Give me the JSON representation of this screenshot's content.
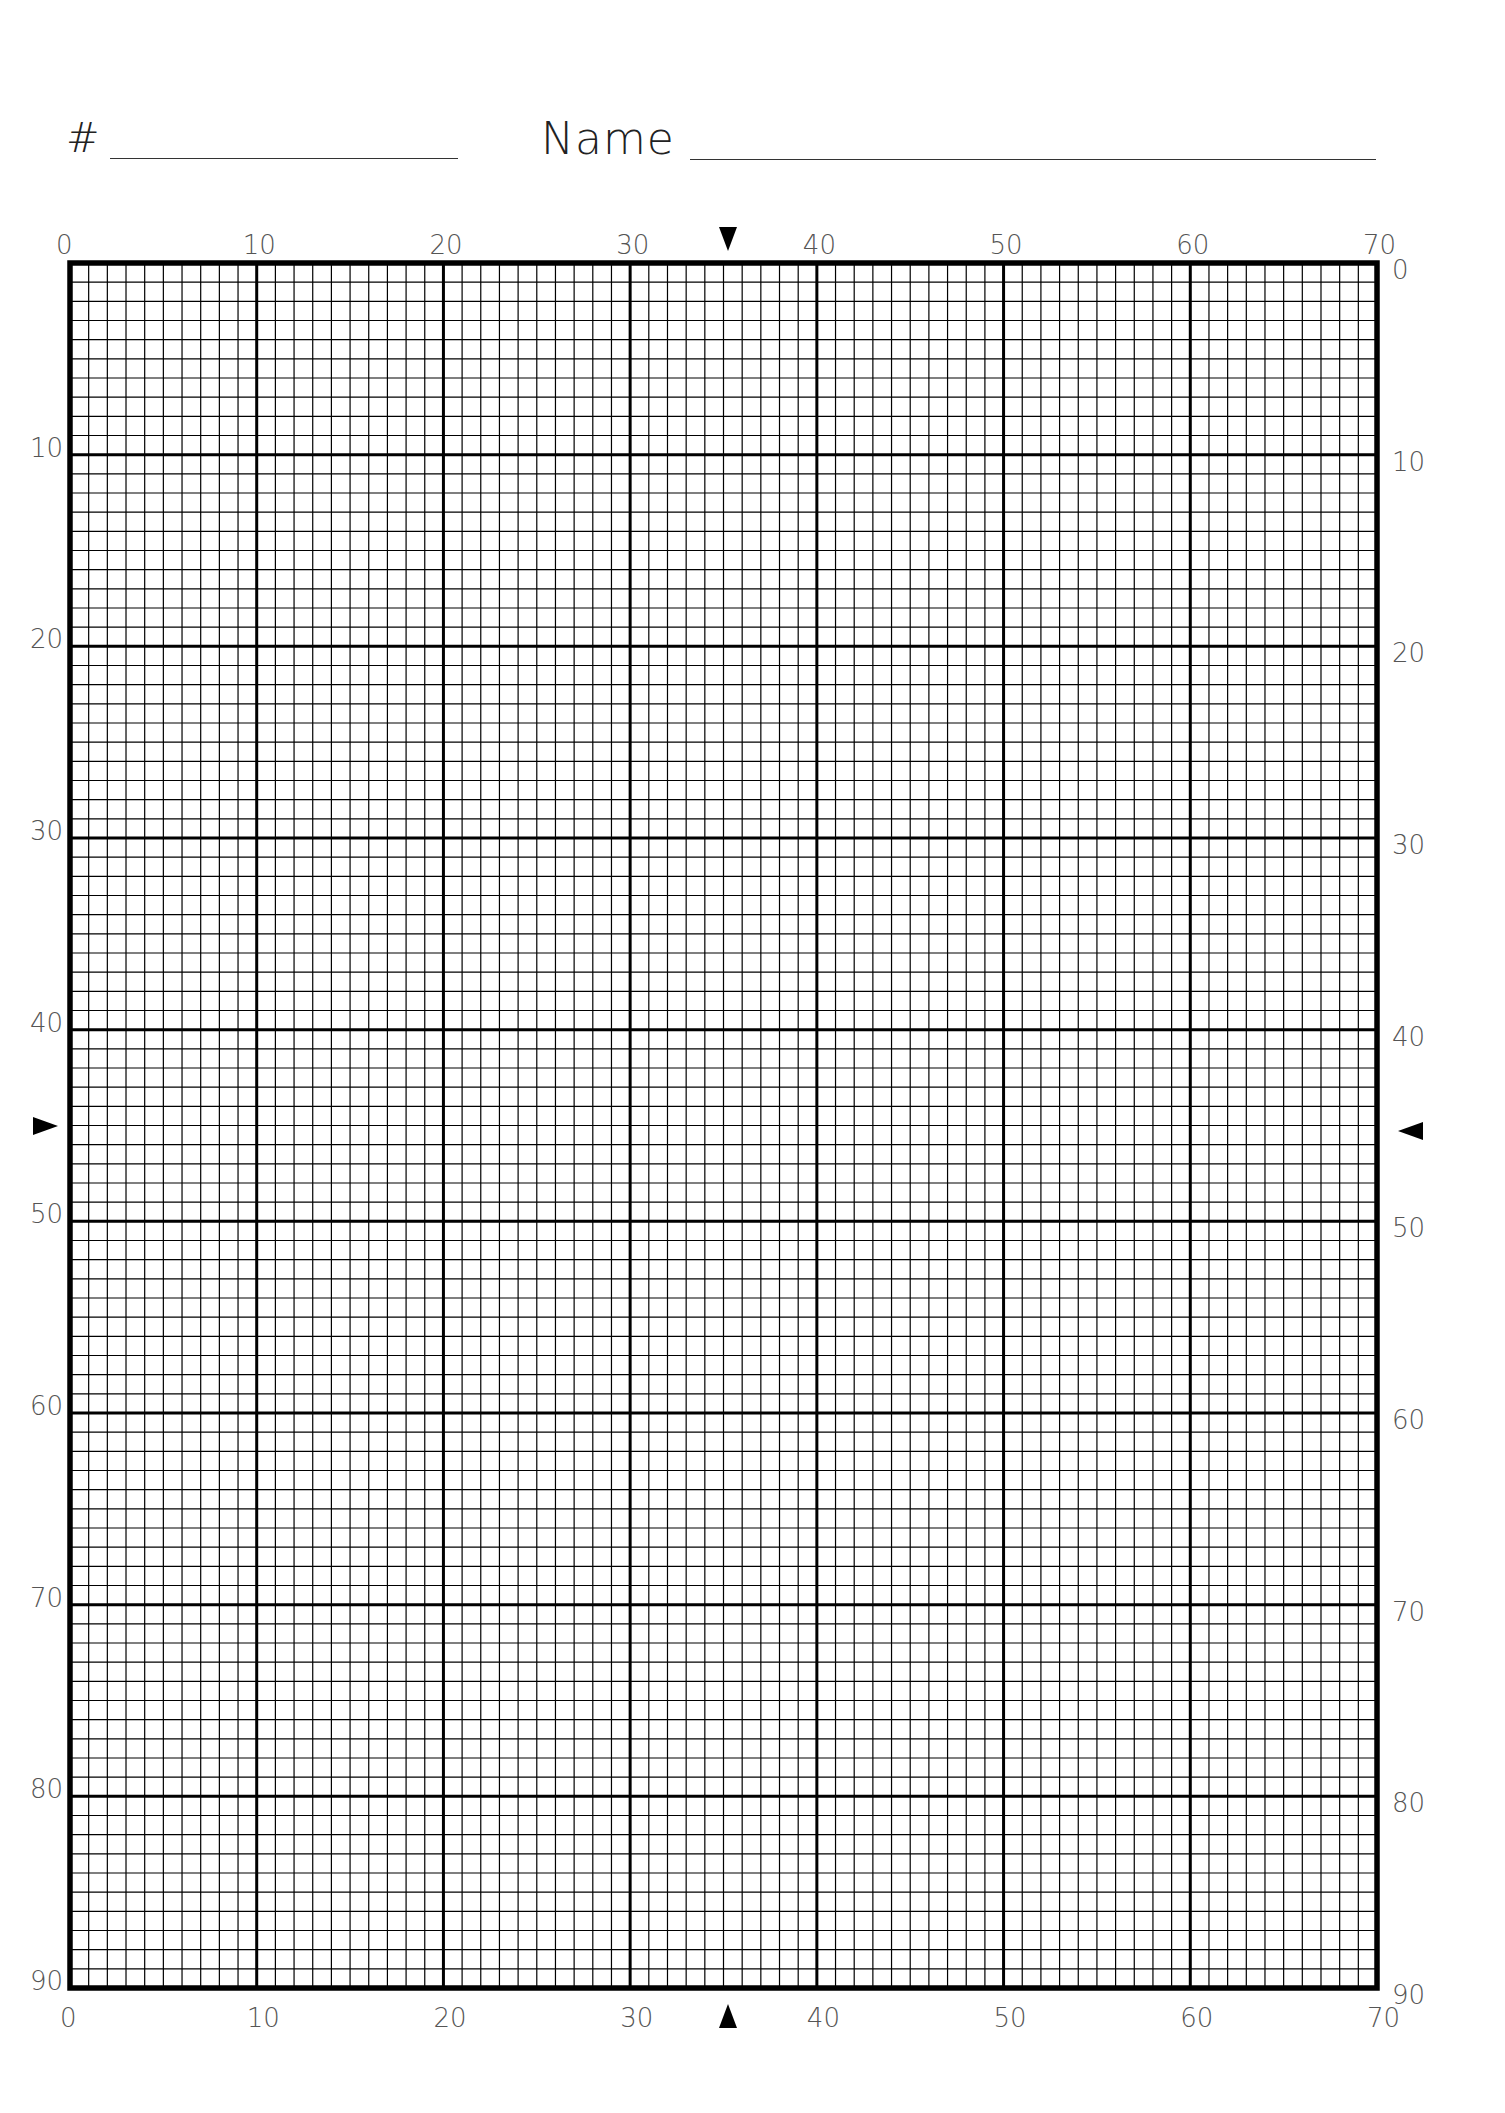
{
  "header": {
    "number_label": "#",
    "name_label": "Name",
    "number_value": "",
    "name_value": ""
  },
  "grid": {
    "columns": 70,
    "rows": 90,
    "major_every": 10,
    "line_color": "#000000",
    "label_color": "#555555",
    "top_labels": [
      "0",
      "10",
      "20",
      "30",
      "40",
      "50",
      "60",
      "70"
    ],
    "bottom_labels": [
      "0",
      "10",
      "20",
      "30",
      "40",
      "50",
      "60",
      "70"
    ],
    "left_labels": [
      "10",
      "20",
      "30",
      "40",
      "50",
      "60",
      "70",
      "80",
      "90"
    ],
    "right_labels": [
      "0",
      "10",
      "20",
      "30",
      "40",
      "50",
      "60",
      "70",
      "80",
      "90"
    ],
    "center_column": 35,
    "center_row": 45
  },
  "chart_data": {
    "type": "table",
    "x": {
      "min": 0,
      "max": 70,
      "major_step": 10,
      "minor_step": 1,
      "tick_labels": [
        "0",
        "10",
        "20",
        "30",
        "40",
        "50",
        "60",
        "70"
      ]
    },
    "y": {
      "min": 0,
      "max": 90,
      "major_step": 10,
      "minor_step": 1,
      "tick_labels": [
        "0",
        "10",
        "20",
        "30",
        "40",
        "50",
        "60",
        "70",
        "80",
        "90"
      ]
    },
    "center_markers": {
      "column": 35,
      "row": 45
    },
    "grid": true
  }
}
